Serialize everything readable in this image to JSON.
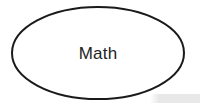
{
  "canvas": {
    "width": 200,
    "height": 111,
    "background_color": "#ffffff"
  },
  "diagram": {
    "type": "ellipse-node-diagram",
    "node": {
      "shape": "ellipse",
      "label": "Math",
      "label_color": "#232323",
      "stroke_color": "#1a1a1a",
      "stroke_width": 2,
      "fill_color": "#ffffff",
      "center_x": 98,
      "center_y": 53,
      "radius_x": 86,
      "radius_y": 46
    },
    "shadow": {
      "name": "drop-shadow-artifact",
      "color": "#e8e8e8",
      "x": 150,
      "y": 94,
      "width": 50,
      "height": 9
    }
  }
}
